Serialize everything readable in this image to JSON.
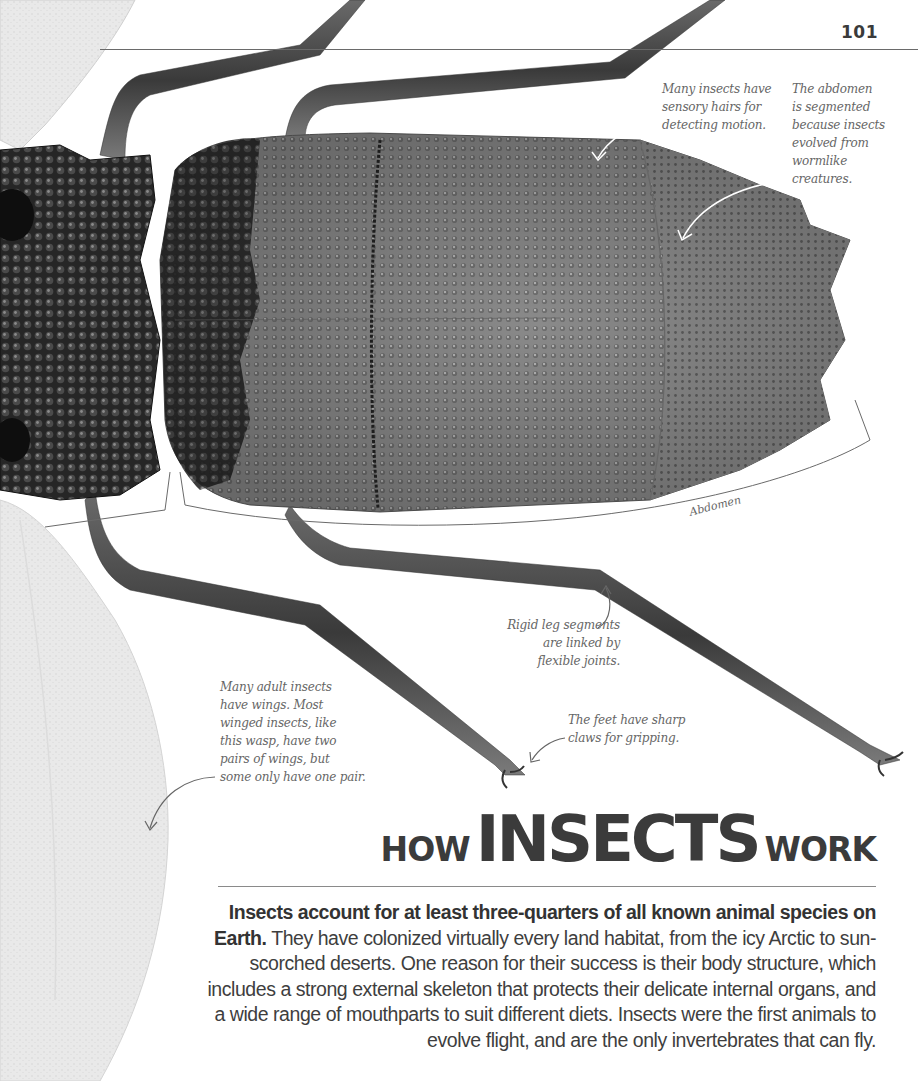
{
  "page": {
    "number": "101"
  },
  "callouts": {
    "sensory_hairs": "Many insects have\nsensory hairs for\ndetecting motion.",
    "abdomen_segmented": "The abdomen\nis segmented\nbecause insects\nevolved from\nwormlike\ncreatures.",
    "leg_segments": "Rigid leg segments\nare linked by\nflexible joints.",
    "wings": "Many adult insects\nhave wings. Most\nwinged insects, like\nthis wasp, have two\npairs of wings, but\nsome only have one pair.",
    "feet": "The feet have sharp\nclaws for gripping."
  },
  "labels": {
    "abdomen": "Abdomen"
  },
  "title": {
    "prefix": "HOW",
    "main": "INSECTS",
    "suffix": "WORK"
  },
  "intro": {
    "lead": "Insects account for at least three-quarters of all known animal species on Earth.",
    "body": " They have colonized virtually every land habitat, from the icy Arctic to sun-scorched deserts. One reason for their success is their body structure, which includes a strong external skeleton that protects their delicate internal organs, and a wide range of mouthparts to suit different diets. Insects were the first animals to evolve flight, and are the only invertebrates that can fly."
  },
  "colors": {
    "text": "#3a3a3a",
    "callout_text": "#666666",
    "rule": "#6a6a6a",
    "wing": "#e6e6e6",
    "exoskeleton_dark": "#2a2a2a",
    "exoskeleton_mid": "#7a7a7a",
    "exoskeleton_light": "#9a9a9a"
  }
}
